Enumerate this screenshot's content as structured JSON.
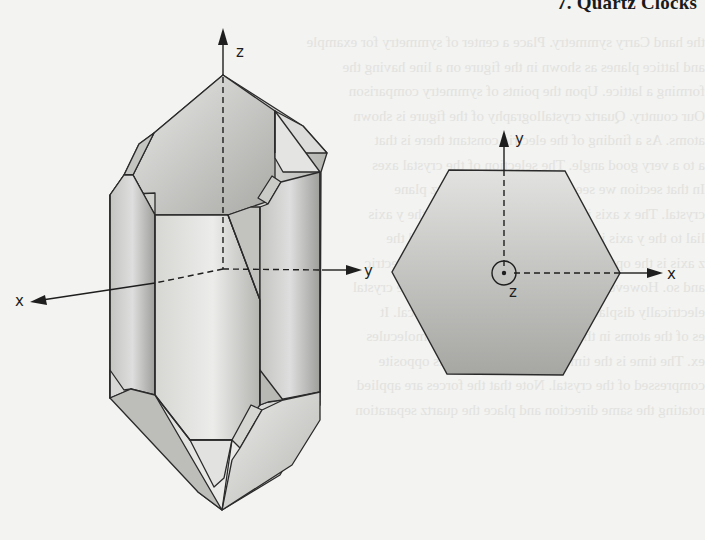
{
  "page": {
    "running_header": "7. Quartz Clocks",
    "background_color": "#f3f3f1",
    "bleed_through_lines": [
      "the hand Carry symmetry. Place a center of symmetry for example",
      "and lattice planes as shown in the figure on a line having the",
      "forming a lattice. Upon the points of symmetry comparison",
      "Our country. Quartz crystallography of the figure is shown",
      "atoms. As a finding of the electric constant there is that",
      "a to a very good angle. The selection of the crystal axes",
      "In that section we see the crystal of the quartz plane",
      "crystal. The x axis is called the electrical axis, the y axis",
      "lial to the y axis is called the mechanical axis and the",
      "z axis is the optical axis, the axis having no piezoelectric",
      "and so. However, the x axis a constant of the whole crystal",
      "electrically displacement as shown by the electrical. It",
      "es of the atoms in the crystal with a pattern of molecules",
      "ex. The time is the time and electric charge is opposite",
      "compressed of the crystal. Note that the forces are applied",
      "rotating the same direction and place the quartz separation"
    ]
  },
  "figure": {
    "left_crystal": {
      "title": "quartz crystal (3D view)",
      "axes": {
        "z_label": "z",
        "y_label": "y",
        "x_label": "x"
      },
      "colors": {
        "outline": "#2a2a2a",
        "face_light": "#e6e6e4",
        "face_mid": "#c9c9c6",
        "face_dark": "#a3a3a0"
      }
    },
    "right_section": {
      "title": "hexagonal cross-section (top view)",
      "axes": {
        "y_label": "y",
        "x_label": "x",
        "z_label": "z"
      },
      "colors": {
        "outline": "#2a2a2a",
        "fill_top": "#dcdcda",
        "fill_bottom": "#a9a9a6"
      }
    }
  }
}
